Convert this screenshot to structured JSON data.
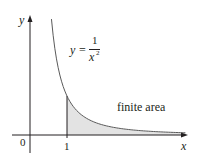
{
  "figure": {
    "function_label": {
      "lhs": "y",
      "eq": "=",
      "numerator": "1",
      "denominator": "x",
      "exponent": "2"
    },
    "axis_labels": {
      "x": "x",
      "y": "y"
    },
    "tick_labels": {
      "origin": "0",
      "one": "1"
    },
    "region_label": "finite area",
    "colors": {
      "curve": "#5a5a5a",
      "axis": "#231f20",
      "shade": "#e3e3e3",
      "text": "#231f20"
    },
    "mapping": {
      "origin_px": [
        30,
        135
      ],
      "x_unit_px": 37,
      "y_unit_px": 39
    },
    "curve": {
      "x_start": 0.58,
      "x_end": 4.2
    },
    "shade": {
      "x_start": 1,
      "x_end": 4.2
    }
  }
}
